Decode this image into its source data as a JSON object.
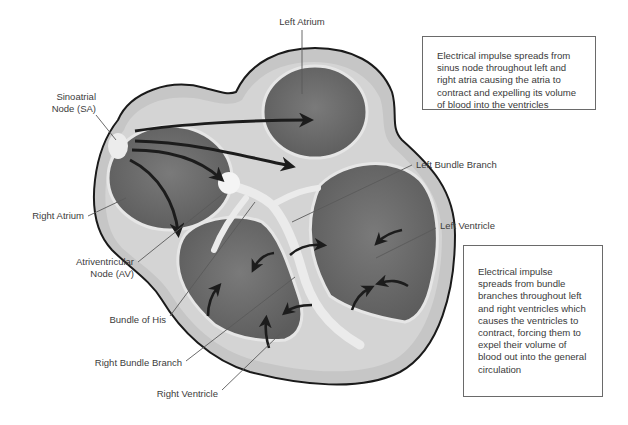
{
  "diagram": {
    "labels": {
      "left_atrium": "Left Atrium",
      "sa_node_line1": "Sinoatrial",
      "sa_node_line2": "Node (SA)",
      "right_atrium": "Right Atrium",
      "av_node_line1": "Atriventricular",
      "av_node_line2": "Node (AV)",
      "bundle_of_his": "Bundle of His",
      "right_bundle_branch": "Right Bundle Branch",
      "right_ventricle": "Right Ventricle",
      "left_bundle_branch": "Left Bundle Branch",
      "left_ventricle": "Left Ventricle"
    },
    "notes": {
      "atria": "Electrical impulse spreads from sinus node throughout left and right atria causing the atria to contract and expelling its volume of blood into the ventricles",
      "ventricles": "Electrical impulse spreads from bundle branches throughout left and right ventricles which causes the ventricles to contract, forcing them to expel their volume of blood out into the general circulation"
    },
    "colors": {
      "outline": "#1a1a1a",
      "wall": "#bdbdbd",
      "chamber": "#6e6e6e",
      "conduction": "#f0f0f0",
      "arrow": "#1c1c1c"
    }
  }
}
